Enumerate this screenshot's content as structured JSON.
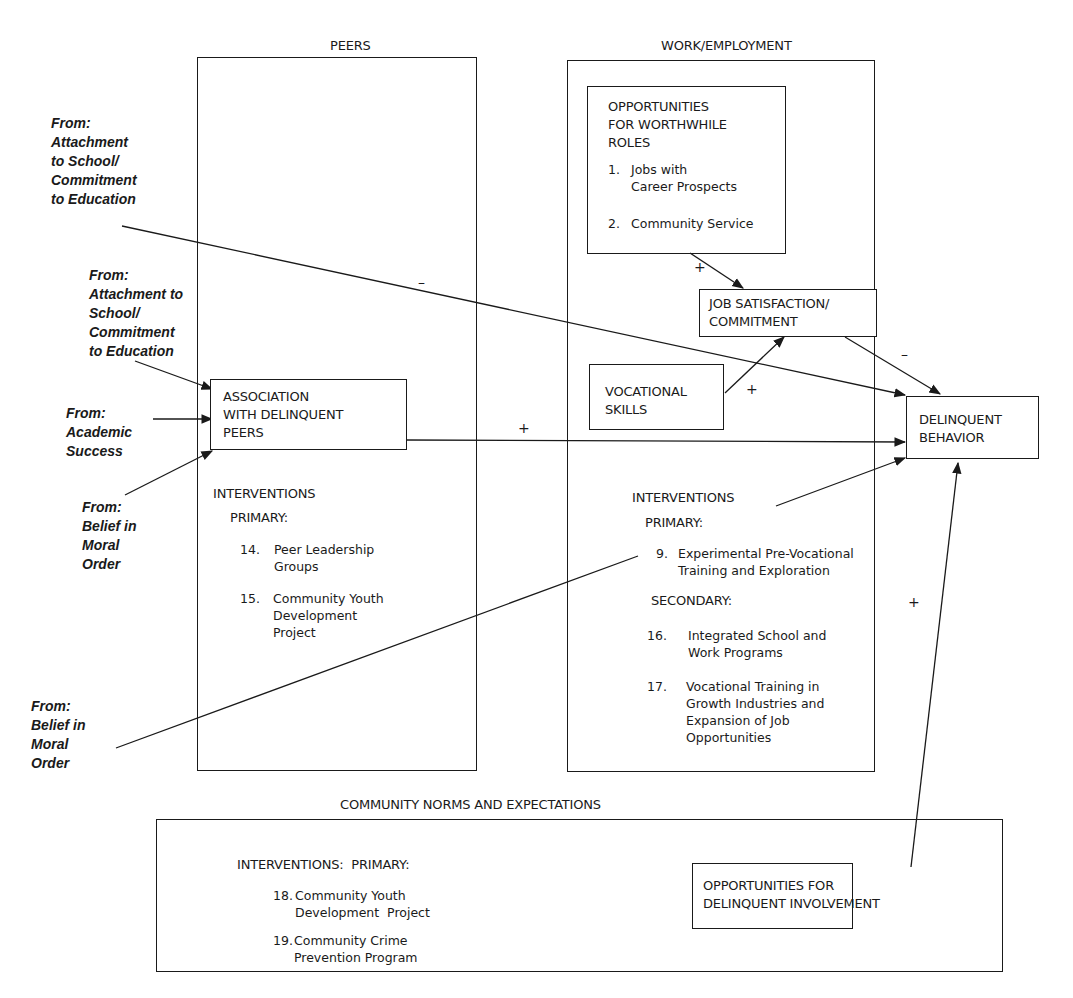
{
  "diagram": {
    "sections": {
      "peers": {
        "title": "PEERS",
        "node": "ASSOCIATION\nWITH DELINQUENT\nPEERS",
        "interventions_label": "INTERVENTIONS",
        "primary_label": "PRIMARY:",
        "items": [
          {
            "num": "14.",
            "text": "Peer Leadership\nGroups"
          },
          {
            "num": "15.",
            "text": "Community Youth\nDevelopment\nProject"
          }
        ]
      },
      "work": {
        "title": "WORK/EMPLOYMENT",
        "opportunities_node": {
          "title": "OPPORTUNITIES\nFOR WORTHWHILE\nROLES",
          "items": [
            {
              "num": "1.",
              "text": "Jobs with\nCareer Prospects"
            },
            {
              "num": "2.",
              "text": "Community Service"
            }
          ]
        },
        "job_satisfaction_node": "JOB SATISFACTION/\nCOMMITMENT",
        "vocational_node": "VOCATIONAL\nSKILLS",
        "interventions_label": "INTERVENTIONS",
        "primary_label": "PRIMARY:",
        "primary_items": [
          {
            "num": "9.",
            "text": "Experimental Pre-Vocational\nTraining and Exploration"
          }
        ],
        "secondary_label": "SECONDARY:",
        "secondary_items": [
          {
            "num": "16.",
            "text": "Integrated School and\nWork Programs"
          },
          {
            "num": "17.",
            "text": "Vocational Training in\nGrowth Industries and\nExpansion of Job\nOpportunities"
          }
        ]
      },
      "community": {
        "title": "COMMUNITY NORMS AND EXPECTATIONS",
        "interventions_label": "INTERVENTIONS:  PRIMARY:",
        "items": [
          {
            "num": "18.",
            "text": "Community Youth\nDevelopment  Project"
          },
          {
            "num": "19.",
            "text": "Community Crime\nPrevention Program"
          }
        ],
        "opportunities_node": "OPPORTUNITIES FOR\nDELINQUENT INVOLVEMENT"
      }
    },
    "outcome_node": "DELINQUENT\nBEHAVIOR",
    "external_inputs": [
      "From:\nAttachment\nto School/\nCommitment\nto Education",
      "From:\nAttachment to\nSchool/\nCommitment\nto Education",
      "From:\nAcademic\nSuccess",
      "From:\nBelief in\nMoral\nOrder",
      "From:\nBelief in\nMoral\nOrder"
    ],
    "edge_signs": {
      "school_to_behavior": "–",
      "peers_to_behavior": "+",
      "opportunities_to_job": "+",
      "vocational_to_job": "+",
      "job_to_behavior": "–",
      "community_to_behavior": "+"
    },
    "colors": {
      "ink": "#1a1a1a",
      "background": "#ffffff"
    }
  }
}
